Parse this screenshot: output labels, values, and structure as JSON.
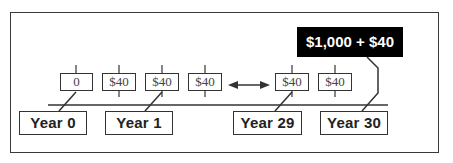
{
  "diagram": {
    "type": "cash-flow-timeline",
    "payments": [
      {
        "id": "p0",
        "label": "0"
      },
      {
        "id": "p1",
        "label": "$40"
      },
      {
        "id": "p2",
        "label": "$40"
      },
      {
        "id": "p3",
        "label": "$40"
      },
      {
        "id": "p29",
        "label": "$40"
      },
      {
        "id": "p30",
        "label": "$40"
      }
    ],
    "years": [
      {
        "id": "y0",
        "label": "Year 0"
      },
      {
        "id": "y1",
        "label": "Year 1"
      },
      {
        "id": "y29",
        "label": "Year 29"
      },
      {
        "id": "y30",
        "label": "Year 30"
      }
    ],
    "final_payment": {
      "label": "$1,000 + $40"
    },
    "ellipsis_arrow": "double-headed-arrow",
    "colors": {
      "line": "#333333",
      "callout_bg": "#000000",
      "callout_text": "#ffffff"
    }
  }
}
